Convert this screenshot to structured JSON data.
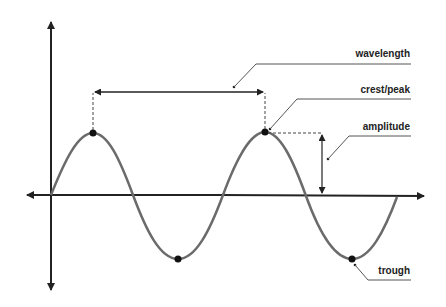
{
  "diagram": {
    "labels": {
      "wavelength": "wavelength",
      "crest": "crest/peak",
      "amplitude": "amplitude",
      "trough": "trough"
    },
    "colors": {
      "axis": "#222222",
      "wave": "#6b6b6b",
      "annotation": "#333333"
    }
  }
}
